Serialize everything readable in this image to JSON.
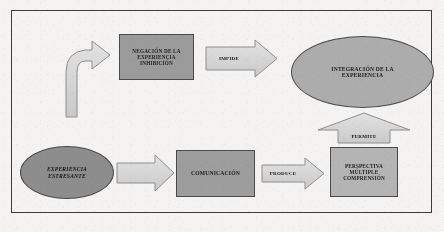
{
  "diagram": {
    "frame": {
      "border_color": "#3b3b3b"
    },
    "colors": {
      "page_background": "#f4f3f1",
      "box_dark": "#9b9b9b",
      "box_medium": "#9d9d9d",
      "box_light": "#b4b4b4",
      "ellipse_light": "#acacac",
      "ellipse_dark": "#8d8d8d",
      "arrow_fill": "#d8d8d8",
      "outline": "#4a4a4a",
      "text": "#1a1a1a"
    },
    "nodes": [
      {
        "id": "negacion",
        "shape": "rectangle",
        "lines": [
          "NEGACIÓN DE LA",
          "EXPERIENCIA",
          "INHIBICIÓN"
        ],
        "fill": "#9b9b9b",
        "row": "top"
      },
      {
        "id": "integracion",
        "shape": "ellipse",
        "lines": [
          "INTEGRACIÓN DE LA",
          "EXPERIENCIA"
        ],
        "fill": "#acacac",
        "row": "top"
      },
      {
        "id": "experiencia",
        "shape": "ellipse",
        "lines": [
          "EXPERIENCIA",
          "ESTRESANTE"
        ],
        "fill": "#8d8d8d",
        "style": "italic",
        "row": "bottom"
      },
      {
        "id": "comunicacion",
        "shape": "rectangle",
        "lines": [
          "COMUNICACIÓN"
        ],
        "fill": "#9d9d9d",
        "row": "bottom"
      },
      {
        "id": "perspectiva",
        "shape": "rectangle",
        "lines": [
          "PERSPECTIVA",
          "MÚLTIPLE",
          "COMPRENSIÓN"
        ],
        "fill": "#b4b4b4",
        "row": "bottom"
      }
    ],
    "arrows": [
      {
        "id": "curved-up",
        "label": "",
        "direction": "curved-up-right",
        "from": "experiencia",
        "to": "negacion"
      },
      {
        "id": "impide",
        "label": "IMPIDE",
        "direction": "right",
        "from": "negacion",
        "to": "integracion"
      },
      {
        "id": "comunica",
        "label": "",
        "direction": "right",
        "from": "experiencia",
        "to": "comunicacion"
      },
      {
        "id": "produce",
        "label": "PRODUCE",
        "direction": "right",
        "from": "comunicacion",
        "to": "perspectiva"
      },
      {
        "id": "permite",
        "label": "PERMITE",
        "direction": "up",
        "from": "perspectiva",
        "to": "integracion"
      }
    ]
  }
}
